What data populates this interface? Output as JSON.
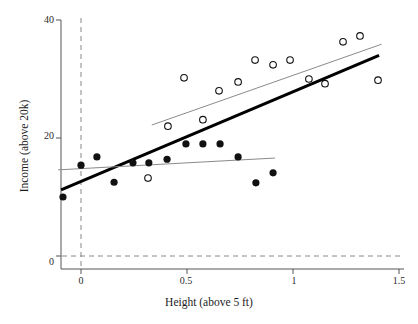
{
  "chart_data": {
    "type": "scatter",
    "title": "",
    "xlabel": "Height (above 5 ft)",
    "ylabel": "Income (above 20k)",
    "xlim": [
      -0.11,
      1.52
    ],
    "ylim": [
      -2.2,
      41.5
    ],
    "xticks": [
      0,
      0.5,
      1,
      1.5
    ],
    "xticklabels": [
      "0",
      "0.5",
      "1",
      "1.5"
    ],
    "yticks": [
      0,
      20,
      40
    ],
    "yticklabels": [
      "0",
      "20",
      "40"
    ],
    "grid": false,
    "legend": "none",
    "reference_lines": [
      {
        "name": "x-zero-dashed",
        "orientation": "vertical",
        "value": 0,
        "style": "dashed",
        "color": "#888888"
      },
      {
        "name": "y-zero-dashed",
        "orientation": "horizontal",
        "value": 0,
        "style": "dashed",
        "color": "#888888"
      }
    ],
    "series": [
      {
        "name": "filled-points",
        "marker": "filled-circle",
        "color": "#111111",
        "points": [
          {
            "x": -0.085,
            "y": 10.0
          },
          {
            "x": 0.0,
            "y": 15.4
          },
          {
            "x": 0.075,
            "y": 16.8
          },
          {
            "x": 0.156,
            "y": 12.5
          },
          {
            "x": 0.245,
            "y": 15.8
          },
          {
            "x": 0.32,
            "y": 15.8
          },
          {
            "x": 0.406,
            "y": 16.4
          },
          {
            "x": 0.495,
            "y": 19.0
          },
          {
            "x": 0.575,
            "y": 19.0
          },
          {
            "x": 0.656,
            "y": 19.0
          },
          {
            "x": 0.741,
            "y": 16.8
          },
          {
            "x": 0.825,
            "y": 12.4
          },
          {
            "x": 0.906,
            "y": 14.1
          }
        ]
      },
      {
        "name": "open-points",
        "marker": "open-circle",
        "color": "#111111",
        "points": [
          {
            "x": 0.316,
            "y": 13.2
          },
          {
            "x": 0.41,
            "y": 22.0
          },
          {
            "x": 0.486,
            "y": 30.2
          },
          {
            "x": 0.575,
            "y": 23.1
          },
          {
            "x": 0.651,
            "y": 28.0
          },
          {
            "x": 0.741,
            "y": 29.5
          },
          {
            "x": 0.821,
            "y": 33.2
          },
          {
            "x": 0.906,
            "y": 32.4
          },
          {
            "x": 0.986,
            "y": 33.2
          },
          {
            "x": 1.075,
            "y": 30.0
          },
          {
            "x": 1.151,
            "y": 29.2
          },
          {
            "x": 1.236,
            "y": 36.3
          },
          {
            "x": 1.316,
            "y": 37.3
          },
          {
            "x": 1.401,
            "y": 29.8
          }
        ]
      }
    ],
    "fit_lines": [
      {
        "name": "pooled-regression-line",
        "color": "#000000",
        "width": 3.0,
        "x0": -0.094,
        "y0": 11.2,
        "x1": 1.406,
        "y1": 34.0
      },
      {
        "name": "filled-group-regression-line",
        "color": "#8a8a8a",
        "width": 1.0,
        "x0": -0.108,
        "y0": 14.6,
        "x1": 0.915,
        "y1": 16.6
      },
      {
        "name": "open-group-regression-line",
        "color": "#8a8a8a",
        "width": 1.0,
        "x0": 0.334,
        "y0": 22.2,
        "x1": 1.418,
        "y1": 35.9
      }
    ]
  },
  "axes": {
    "x_title": "Height (above 5 ft)",
    "y_title": "Income (above 20k)",
    "x_tick_0": "0",
    "x_tick_1": "0.5",
    "x_tick_2": "1",
    "x_tick_3": "1.5",
    "y_tick_0": "0",
    "y_tick_1": "20",
    "y_tick_2": "40"
  }
}
